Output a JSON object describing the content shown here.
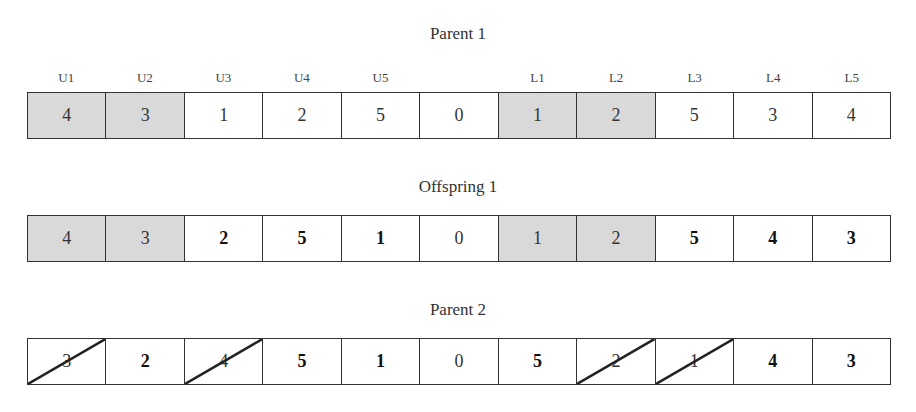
{
  "diagram": {
    "rows": [
      {
        "title": "Parent 1",
        "labels": [
          "U1",
          "U2",
          "U3",
          "U4",
          "U5",
          "",
          "L1",
          "L2",
          "L3",
          "L4",
          "L5"
        ],
        "cells": [
          {
            "value": "4",
            "shaded": true,
            "bold": false,
            "struck": false
          },
          {
            "value": "3",
            "shaded": true,
            "bold": false,
            "struck": false
          },
          {
            "value": "1",
            "shaded": false,
            "bold": false,
            "struck": false
          },
          {
            "value": "2",
            "shaded": false,
            "bold": false,
            "struck": false
          },
          {
            "value": "5",
            "shaded": false,
            "bold": false,
            "struck": false
          },
          {
            "value": "0",
            "shaded": false,
            "bold": false,
            "struck": false
          },
          {
            "value": "1",
            "shaded": true,
            "bold": false,
            "struck": false
          },
          {
            "value": "2",
            "shaded": true,
            "bold": false,
            "struck": false
          },
          {
            "value": "5",
            "shaded": false,
            "bold": false,
            "struck": false
          },
          {
            "value": "3",
            "shaded": false,
            "bold": false,
            "struck": false
          },
          {
            "value": "4",
            "shaded": false,
            "bold": false,
            "struck": false
          }
        ]
      },
      {
        "title": "Offspring 1",
        "cells": [
          {
            "value": "4",
            "shaded": true,
            "bold": false,
            "struck": false
          },
          {
            "value": "3",
            "shaded": true,
            "bold": false,
            "struck": false
          },
          {
            "value": "2",
            "shaded": false,
            "bold": true,
            "struck": false
          },
          {
            "value": "5",
            "shaded": false,
            "bold": true,
            "struck": false
          },
          {
            "value": "1",
            "shaded": false,
            "bold": true,
            "struck": false
          },
          {
            "value": "0",
            "shaded": false,
            "bold": false,
            "struck": false
          },
          {
            "value": "1",
            "shaded": true,
            "bold": false,
            "struck": false
          },
          {
            "value": "2",
            "shaded": true,
            "bold": false,
            "struck": false
          },
          {
            "value": "5",
            "shaded": false,
            "bold": true,
            "struck": false
          },
          {
            "value": "4",
            "shaded": false,
            "bold": true,
            "struck": false
          },
          {
            "value": "3",
            "shaded": false,
            "bold": true,
            "struck": false
          }
        ]
      },
      {
        "title": "Parent 2",
        "cells": [
          {
            "value": "3",
            "shaded": false,
            "bold": false,
            "struck": true
          },
          {
            "value": "2",
            "shaded": false,
            "bold": true,
            "struck": false
          },
          {
            "value": "4",
            "shaded": false,
            "bold": false,
            "struck": true
          },
          {
            "value": "5",
            "shaded": false,
            "bold": true,
            "struck": false
          },
          {
            "value": "1",
            "shaded": false,
            "bold": true,
            "struck": false
          },
          {
            "value": "0",
            "shaded": false,
            "bold": false,
            "struck": false
          },
          {
            "value": "5",
            "shaded": false,
            "bold": true,
            "struck": false
          },
          {
            "value": "2",
            "shaded": false,
            "bold": false,
            "struck": true
          },
          {
            "value": "1",
            "shaded": false,
            "bold": false,
            "struck": true
          },
          {
            "value": "4",
            "shaded": false,
            "bold": true,
            "struck": false
          },
          {
            "value": "3",
            "shaded": false,
            "bold": true,
            "struck": false
          }
        ]
      }
    ],
    "colors": {
      "shaded": "#d9d9d9",
      "border": "#333333",
      "background": "#ffffff"
    }
  }
}
